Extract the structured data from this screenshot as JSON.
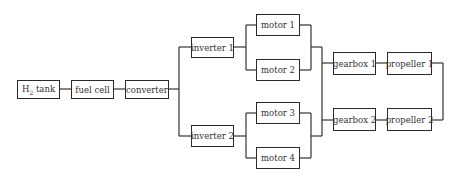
{
  "diagram": {
    "title": "",
    "line_color": "#333333",
    "nodes": {
      "h2_tank": {
        "label": "H",
        "sub": "2",
        "suffix": " tank"
      },
      "fuel_cell": {
        "label": "fuel cell"
      },
      "converter": {
        "label": "converter"
      },
      "inverter_1": {
        "label": "inverter 1"
      },
      "inverter_2": {
        "label": "inverter 2"
      },
      "motor_1": {
        "label": "motor 1"
      },
      "motor_2": {
        "label": "motor 2"
      },
      "motor_3": {
        "label": "motor 3"
      },
      "motor_4": {
        "label": "motor 4"
      },
      "gearbox_1": {
        "label": "gearbox 1"
      },
      "gearbox_2": {
        "label": "gearbox 2"
      },
      "propeller_1": {
        "label": "propeller 1"
      },
      "propeller_2": {
        "label": "propeller 2"
      }
    },
    "edges": [
      [
        "h2_tank",
        "fuel_cell"
      ],
      [
        "fuel_cell",
        "converter"
      ],
      [
        "converter",
        "inverter_1"
      ],
      [
        "converter",
        "inverter_2"
      ],
      [
        "inverter_1",
        "motor_1"
      ],
      [
        "inverter_1",
        "motor_2"
      ],
      [
        "inverter_2",
        "motor_3"
      ],
      [
        "inverter_2",
        "motor_4"
      ],
      [
        "motor_1",
        "gearbox_1"
      ],
      [
        "motor_2",
        "gearbox_1"
      ],
      [
        "motor_3",
        "gearbox_2"
      ],
      [
        "motor_4",
        "gearbox_2"
      ],
      [
        "motor_1",
        "gearbox_2"
      ],
      [
        "motor_4",
        "gearbox_1"
      ],
      [
        "gearbox_1",
        "propeller_1"
      ],
      [
        "gearbox_2",
        "propeller_2"
      ],
      [
        "propeller_1",
        "propeller_2"
      ]
    ]
  }
}
